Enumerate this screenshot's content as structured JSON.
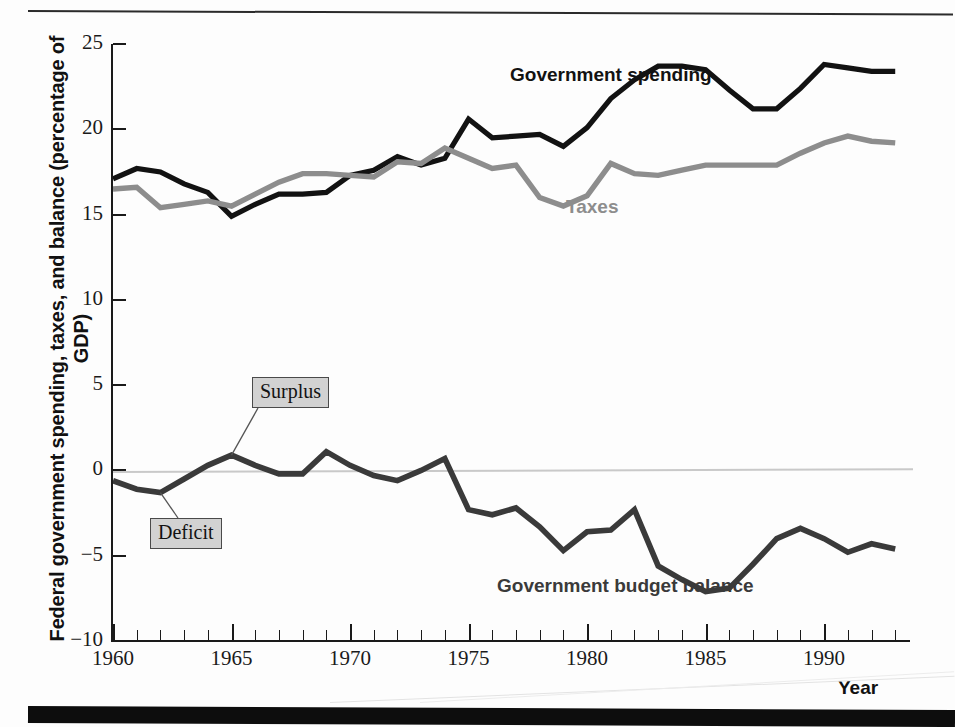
{
  "figure": {
    "y_axis_title": "Federal government spending, taxes, and balance (percentage of GDP)",
    "x_axis_title": "Year"
  },
  "labels": {
    "spending": "Government spending",
    "taxes": "Taxes",
    "balance": "Government budget balance",
    "surplus": "Surplus",
    "deficit": "Deficit"
  },
  "colors": {
    "spending": "#121212",
    "taxes": "#8d8d8d",
    "balance": "#3a3a3a",
    "zero_line": "#c9c9c9",
    "callout_fill": "#d2d2d2",
    "axis": "#1a1a1a"
  },
  "chart_data": {
    "type": "line",
    "title": "",
    "xlabel": "Year",
    "ylabel": "Federal government spending, taxes, and balance (percentage of GDP)",
    "xlim": [
      1960,
      1993
    ],
    "ylim": [
      -10,
      25
    ],
    "yticks": [
      25,
      20,
      15,
      10,
      5,
      0,
      -5,
      -10
    ],
    "ytick_labels": [
      "25",
      "20",
      "15",
      "10",
      "5",
      "0",
      "−5",
      "−10"
    ],
    "xticks": [
      1960,
      1965,
      1970,
      1975,
      1980,
      1985,
      1990
    ],
    "xtick_labels": [
      "1960",
      "1965",
      "1970",
      "1975",
      "1980",
      "1985",
      "1990"
    ],
    "x_minor_tick_interval": 1,
    "grid": false,
    "legend": "inline-annotations",
    "reference_lines": [
      {
        "y": 0,
        "color": "#c9c9c9"
      }
    ],
    "annotations": [
      {
        "text": "Surplus",
        "points_to_x": 1965,
        "points_to_y": 0.9
      },
      {
        "text": "Deficit",
        "points_to_x": 1962,
        "points_to_y": -1.3
      },
      {
        "text": "Government spending",
        "x": 1977,
        "y": 23.2
      },
      {
        "text": "Taxes",
        "x": 1979,
        "y": 17.0
      },
      {
        "text": "Government budget balance",
        "x": 1977,
        "y": -6.2
      }
    ],
    "x": [
      1960,
      1961,
      1962,
      1963,
      1964,
      1965,
      1966,
      1967,
      1968,
      1969,
      1970,
      1971,
      1972,
      1973,
      1974,
      1975,
      1976,
      1977,
      1978,
      1979,
      1980,
      1981,
      1982,
      1983,
      1984,
      1985,
      1986,
      1987,
      1988,
      1989,
      1990,
      1991,
      1992,
      1993
    ],
    "series": [
      {
        "name": "Government spending",
        "color": "#121212",
        "values": [
          17.1,
          17.7,
          17.5,
          16.8,
          16.3,
          14.9,
          15.6,
          16.2,
          16.2,
          16.3,
          17.3,
          17.6,
          18.4,
          17.9,
          18.3,
          20.6,
          19.5,
          19.6,
          19.7,
          19.0,
          20.1,
          21.8,
          22.9,
          23.7,
          23.7,
          23.5,
          22.3,
          21.2,
          21.2,
          22.4,
          23.8,
          23.6,
          23.4,
          23.4
        ]
      },
      {
        "name": "Taxes",
        "color": "#8d8d8d",
        "values": [
          16.5,
          16.6,
          15.4,
          15.6,
          15.8,
          15.5,
          16.2,
          16.9,
          17.4,
          17.4,
          17.3,
          17.2,
          18.1,
          18.0,
          18.9,
          18.3,
          17.7,
          17.9,
          16.0,
          15.5,
          16.1,
          18.0,
          17.4,
          17.3,
          17.6,
          17.9,
          17.9,
          17.9,
          17.9,
          18.6,
          19.2,
          19.6,
          19.3,
          19.2
        ]
      },
      {
        "name": "Government budget balance",
        "color": "#3a3a3a",
        "values": [
          -0.6,
          -1.1,
          -1.3,
          -0.5,
          0.3,
          0.9,
          0.3,
          -0.2,
          -0.2,
          1.1,
          0.3,
          -0.3,
          -0.6,
          0.0,
          0.7,
          -2.3,
          -2.6,
          -2.2,
          -3.3,
          -4.7,
          -3.6,
          -3.5,
          -2.3,
          -5.6,
          -6.4,
          -7.1,
          -6.9,
          -5.5,
          -4.0,
          -3.4,
          -4.0,
          -4.8,
          -4.3,
          -4.6
        ]
      }
    ]
  }
}
